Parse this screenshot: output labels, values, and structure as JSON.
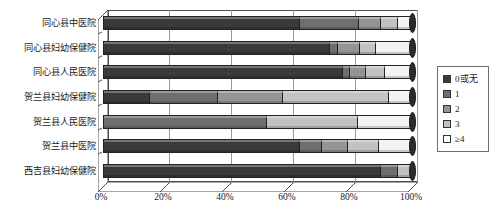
{
  "chart_data": {
    "type": "bar",
    "orientation": "horizontal",
    "stacked": true,
    "normalized": "100%",
    "style": "3d-stacked-bar",
    "title": "",
    "xlabel": "",
    "ylabel": "",
    "xlim": [
      0,
      100
    ],
    "xticks": [
      0,
      20,
      40,
      60,
      80,
      100
    ],
    "xticklabels": [
      "0%",
      "20%",
      "40%",
      "60%",
      "80%",
      "100%"
    ],
    "grid": "vertical",
    "legend_position": "right",
    "categories": [
      "同心县中医院",
      "同心县妇幼保健院",
      "同心县人民医院",
      "贺兰县妇幼保健院",
      "贺兰县人民医院",
      "贺兰县中医院",
      "西吉县妇幼保健院"
    ],
    "series": [
      {
        "name": "0或无",
        "color": "#3a3a3a",
        "values": [
          64,
          74,
          78,
          15,
          0,
          64,
          90
        ]
      },
      {
        "name": "1",
        "color": "#6e6e6e",
        "values": [
          19,
          2,
          2,
          22,
          53,
          7,
          5
        ]
      },
      {
        "name": "2",
        "color": "#949494",
        "values": [
          7,
          7,
          5,
          21,
          0,
          8,
          0
        ]
      },
      {
        "name": "3",
        "color": "#c2c2c2",
        "values": [
          5,
          5,
          6,
          34,
          29,
          10,
          5
        ]
      },
      {
        "name": "≥4",
        "color": "#f2f2f2",
        "values": [
          5,
          12,
          9,
          8,
          18,
          11,
          0
        ]
      }
    ]
  },
  "legend": {
    "items": [
      {
        "label": "0或无",
        "color": "#3a3a3a"
      },
      {
        "label": "1",
        "color": "#6e6e6e"
      },
      {
        "label": "2",
        "color": "#949494"
      },
      {
        "label": "3",
        "color": "#c2c2c2"
      },
      {
        "label": "≥4",
        "color": "#ffffff"
      }
    ]
  }
}
